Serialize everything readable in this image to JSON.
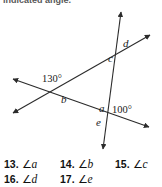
{
  "instruction": {
    "text": "indicated angle."
  },
  "figure": {
    "name": "two-transversals-angle-diagram",
    "line_color": "#2b2b2b",
    "labels": {
      "angle_130": "130°",
      "angle_100": "100°",
      "a": "a",
      "b": "b",
      "c": "c",
      "d": "d",
      "e": "e"
    }
  },
  "exercises": {
    "angle_symbol": "∠",
    "rows": [
      [
        {
          "number": "13.",
          "angle": "a"
        },
        {
          "number": "14.",
          "angle": "b"
        },
        {
          "number": "15.",
          "angle": "c"
        }
      ],
      [
        {
          "number": "16.",
          "angle": "d"
        },
        {
          "number": "17.",
          "angle": "e"
        }
      ]
    ]
  }
}
